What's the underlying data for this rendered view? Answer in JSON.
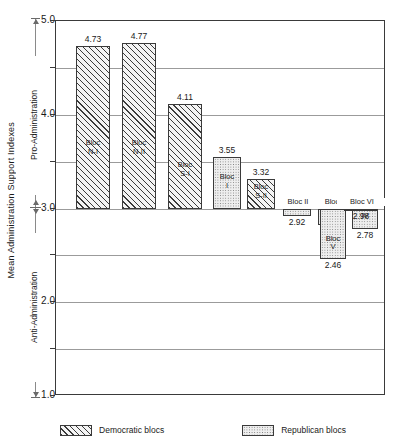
{
  "chart_data": {
    "type": "bar",
    "title": "",
    "xlabel": "",
    "ylabel": "Mean Administration Support Indexes",
    "ylim": [
      1.0,
      5.0
    ],
    "baseline": 3.0,
    "grid": true,
    "gridlines": [
      1.0,
      1.5,
      2.0,
      2.5,
      3.0,
      3.5,
      4.0,
      4.5,
      5.0
    ],
    "tick_labels": [
      "5.0",
      "4.0",
      "3.0",
      "2.0",
      "1.0"
    ],
    "tick_values": [
      5.0,
      4.0,
      3.0,
      2.0,
      1.0
    ],
    "axis_direction_labels": {
      "upper": "Pro-Administration",
      "lower": "Anti-Administration"
    },
    "legend_position": "bottom",
    "categories": [
      "Bloc N-I",
      "Bloc N-II",
      "Bloc S-I",
      "Bloc I",
      "Bloc S-II",
      "Bloc II",
      "Bloc III",
      "Bloc IV",
      "Bloc V",
      "Bloc VI"
    ],
    "values": [
      4.73,
      4.77,
      4.11,
      3.55,
      3.32,
      2.92,
      2.82,
      2.78,
      2.46,
      2.98
    ],
    "series": [
      {
        "name": "Democratic blocs",
        "pattern": "diagonal-hatch",
        "points": [
          {
            "label": "Bloc N-I",
            "line1": "Bloc",
            "line2": "N-I",
            "value": 4.73
          },
          {
            "label": "Bloc N-II",
            "line1": "Bloc",
            "line2": "N-II",
            "value": 4.77
          },
          {
            "label": "Bloc S-I",
            "line1": "Bloc",
            "line2": "S-I",
            "value": 4.11
          },
          {
            "label": "Bloc S-II",
            "line1": "Bloc",
            "line2": "S-II",
            "value": 3.32
          }
        ]
      },
      {
        "name": "Republican blocs",
        "pattern": "stipple",
        "points": [
          {
            "label": "Bloc I",
            "line1": "Bloc",
            "line2": "I",
            "value": 3.55
          },
          {
            "label": "Bloc II",
            "line1": "Bloc II",
            "line2": "",
            "value": 2.92
          },
          {
            "label": "Bloc III",
            "line1": "Bloc",
            "line2": "III",
            "value": 2.82
          },
          {
            "label": "Bloc IV",
            "line1": "Bloc",
            "line2": "IV",
            "value": 2.78
          },
          {
            "label": "Bloc V",
            "line1": "Bloc",
            "line2": "V",
            "value": 2.46
          },
          {
            "label": "Bloc VI",
            "line1": "Bloc VI",
            "line2": "",
            "value": 2.98
          }
        ]
      }
    ],
    "bars": [
      {
        "id": "n-i",
        "line1": "Bloc",
        "line2": "N-I",
        "value": 4.73,
        "value_text": "4.73",
        "party": "dem",
        "x": 20,
        "w": 34,
        "name_pos": "inside",
        "name_y": 118
      },
      {
        "id": "n-ii",
        "line1": "Bloc",
        "line2": "N-II",
        "value": 4.77,
        "value_text": "4.77",
        "party": "dem",
        "x": 66,
        "w": 34,
        "name_pos": "inside",
        "name_y": 118
      },
      {
        "id": "s-i",
        "line1": "Bloc",
        "line2": "S-I",
        "value": 4.11,
        "value_text": "4.11",
        "party": "dem",
        "x": 112,
        "w": 34,
        "name_pos": "inside",
        "name_y": 140
      },
      {
        "id": "i",
        "line1": "Bloc",
        "line2": "I",
        "value": 3.55,
        "value_text": "3.55",
        "party": "rep",
        "x": 157,
        "w": 28,
        "name_pos": "inside",
        "name_y": 152
      },
      {
        "id": "s-ii",
        "line1": "Bloc",
        "line2": "S-II",
        "value": 3.32,
        "value_text": "3.32",
        "party": "dem",
        "x": 191,
        "w": 28,
        "name_pos": "inside",
        "name_y": 162
      },
      {
        "id": "ii",
        "line1": "Bloc II",
        "line2": "",
        "value": 2.92,
        "value_text": "2.92",
        "party": "rep",
        "x": 227,
        "w": 28,
        "name_pos": "above",
        "name_y": 0
      },
      {
        "id": "iii",
        "line1": "Bloc",
        "line2": "III",
        "value": 2.82,
        "value_text": "2.82",
        "party": "rep",
        "x": 262,
        "w": 26,
        "name_pos": "above-split",
        "name_y": 0
      },
      {
        "id": "iv",
        "line1": "Bloc",
        "line2": "IV",
        "value": 2.78,
        "value_text": "2.78",
        "party": "rep",
        "x": 296,
        "w": 26,
        "name_pos": "above-split",
        "name_y": 0
      },
      {
        "id": "v",
        "line1": "Bloc",
        "line2": "V",
        "value": 2.46,
        "value_text": "2.46",
        "party": "rep",
        "x": 264,
        "w": 26,
        "name_pos": "inside",
        "name_y": 0
      },
      {
        "id": "vi",
        "line1": "Bloc VI",
        "line2": "",
        "value": 2.98,
        "value_text": "2.98",
        "party": "rep",
        "x": 288,
        "w": 34,
        "name_pos": "above",
        "name_y": 0
      }
    ]
  },
  "legend": {
    "democratic_label": "Democratic blocs",
    "republican_label": "Republican blocs"
  }
}
